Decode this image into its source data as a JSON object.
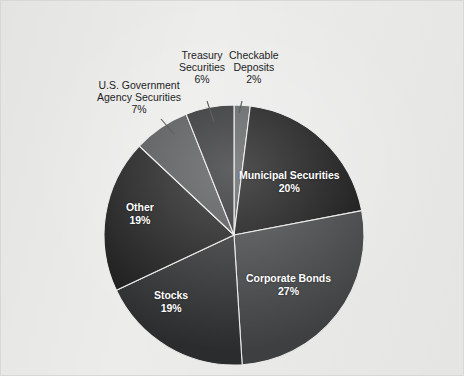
{
  "figure": {
    "name": "asset-allocation-pie-chart",
    "background_color": "#ececeb",
    "border_color": "#d8d8d6"
  },
  "chart_data": {
    "type": "pie",
    "title": "",
    "subtitle": "",
    "xlabel": "",
    "ylabel": "",
    "units": "percent",
    "total": 100,
    "legend_position": "none",
    "grid": false,
    "start_angle_deg": 0,
    "direction": "clockwise",
    "categories": [
      "Checkable Deposits",
      "Municipal Securities",
      "Corporate Bonds",
      "Stocks",
      "Other",
      "U.S. Government Agency Securities",
      "Treasury Securities"
    ],
    "values": [
      2,
      20,
      27,
      19,
      19,
      7,
      6
    ],
    "slices": [
      {
        "id": "checkable-deposits",
        "label": "Checkable Deposits",
        "value": 2,
        "value_text": "2%",
        "color": "#55585a",
        "label_placement": "outside",
        "label_color": "#1d1d1d"
      },
      {
        "id": "municipal-securities",
        "label": "Municipal Securities",
        "value": 20,
        "value_text": "20%",
        "color": "#0e0e0e",
        "label_placement": "inside",
        "label_color": "#ffffff"
      },
      {
        "id": "corporate-bonds",
        "label": "Corporate Bonds",
        "value": 27,
        "value_text": "27%",
        "color": "#3e4042",
        "label_placement": "inside",
        "label_color": "#ffffff"
      },
      {
        "id": "stocks",
        "label": "Stocks",
        "value": 19,
        "value_text": "19%",
        "color": "#2b2c2d",
        "label_placement": "inside",
        "label_color": "#ffffff"
      },
      {
        "id": "other",
        "label": "Other",
        "value": 19,
        "value_text": "19%",
        "color": "#181818",
        "label_placement": "inside",
        "label_color": "#ffffff"
      },
      {
        "id": "us-government-agency-securities",
        "label": "U.S. Government Agency Securities",
        "label_line1": "U.S. Government",
        "label_line2": "Agency Securities",
        "value": 7,
        "value_text": "7%",
        "color": "#4b4d4f",
        "label_placement": "outside",
        "label_color": "#1d1d1d"
      },
      {
        "id": "treasury-securities",
        "label": "Treasury Securities",
        "label_line1": "Treasury",
        "label_line2": "Securities",
        "value": 6,
        "value_text": "6%",
        "color": "#232425",
        "label_placement": "outside",
        "label_color": "#1d1d1d"
      }
    ]
  }
}
